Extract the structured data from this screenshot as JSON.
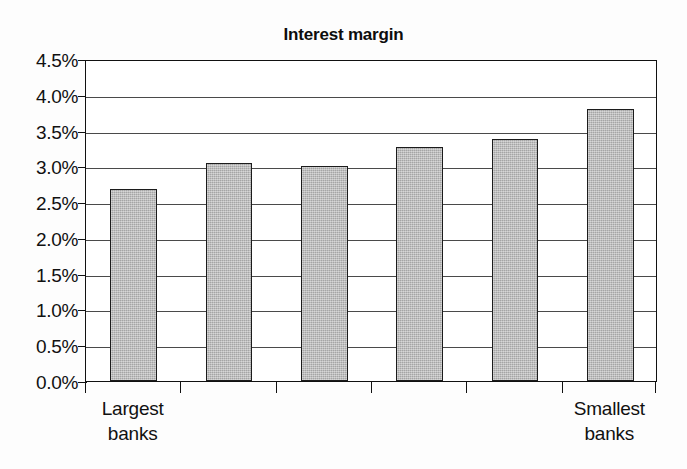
{
  "chart_data": {
    "type": "bar",
    "title": "Interest margin",
    "xlabel": "",
    "ylabel": "",
    "categories": [
      "Largest banks",
      "",
      "",
      "",
      "",
      "Smallest banks"
    ],
    "category_labels": [
      {
        "line1": "Largest",
        "line2": "banks"
      },
      {
        "line1": "",
        "line2": ""
      },
      {
        "line1": "",
        "line2": ""
      },
      {
        "line1": "",
        "line2": ""
      },
      {
        "line1": "",
        "line2": ""
      },
      {
        "line1": "Smallest",
        "line2": "banks"
      }
    ],
    "values": [
      2.68,
      3.05,
      3.01,
      3.27,
      3.38,
      3.8
    ],
    "value_labels": [
      "2.68%",
      "3.05%",
      "3.01%",
      "3.27%",
      "3.38%",
      "3.80%"
    ],
    "ylim": [
      0.0,
      4.5
    ],
    "ytick_values": [
      4.5,
      4.0,
      3.5,
      3.0,
      2.5,
      2.0,
      1.5,
      1.0,
      0.5,
      0.0
    ],
    "ytick_labels": [
      "4.5%",
      "4.0%",
      "3.5%",
      "3.0%",
      "2.5%",
      "2.0%",
      "1.5%",
      "1.0%",
      "0.5%",
      "0.0%"
    ],
    "grid": true,
    "grid_axis": "y",
    "legend": false,
    "legend_position": "none",
    "bar_color": "#b4b4b4",
    "bar_edge_color": "#1c1c1c",
    "axis_color": "#111111",
    "grid_color": "#4a4a4a",
    "background_color": "#ffffff",
    "series": [
      {
        "name": "Interest margin",
        "values": [
          2.68,
          3.05,
          3.01,
          3.27,
          3.38,
          3.8
        ]
      }
    ]
  }
}
